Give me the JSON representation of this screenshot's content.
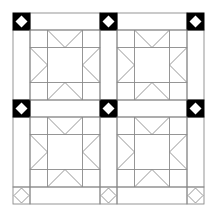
{
  "diagram": {
    "title": "",
    "type": "quilt-layout",
    "colors": {
      "line": "#8a8a8a",
      "dark_cornerstone": "#000000",
      "background": "#ffffff"
    },
    "grid": {
      "edges": [
        13,
        30,
        100,
        117,
        187,
        204
      ],
      "sash_width": 17,
      "block_size": 70
    },
    "cornerstones": [
      {
        "row": 0,
        "col": 0,
        "style": "dark"
      },
      {
        "row": 0,
        "col": 1,
        "style": "dark"
      },
      {
        "row": 0,
        "col": 2,
        "style": "dark"
      },
      {
        "row": 1,
        "col": 0,
        "style": "dark"
      },
      {
        "row": 1,
        "col": 1,
        "style": "dark"
      },
      {
        "row": 1,
        "col": 2,
        "style": "dark"
      },
      {
        "row": 2,
        "col": 0,
        "style": "light"
      },
      {
        "row": 2,
        "col": 1,
        "style": "light"
      },
      {
        "row": 2,
        "col": 2,
        "style": "light"
      }
    ],
    "blocks": [
      {
        "row": 0,
        "col": 0,
        "pattern": "sawtooth-star"
      },
      {
        "row": 0,
        "col": 1,
        "pattern": "sawtooth-star"
      },
      {
        "row": 1,
        "col": 0,
        "pattern": "sawtooth-star"
      },
      {
        "row": 1,
        "col": 1,
        "pattern": "sawtooth-star"
      }
    ]
  }
}
